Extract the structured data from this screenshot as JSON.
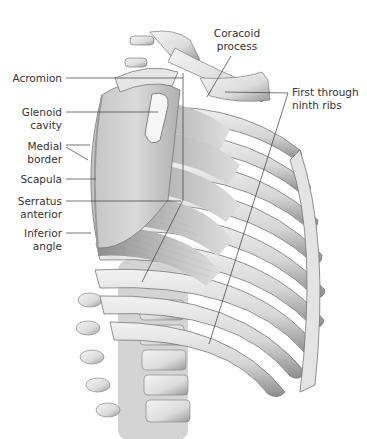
{
  "figure": {
    "colors": {
      "background": "#ffffff",
      "bone_light": "#eeeeee",
      "bone_mid": "#c8c8c8",
      "bone_dark": "#8a8a8a",
      "muscle": "#a9a9a9",
      "muscle_dark": "#6e6e6e",
      "leader_line": "#3a3a3a",
      "text": "#333333"
    }
  },
  "labels": [
    {
      "id": "acromion",
      "lines": [
        "Acromion"
      ],
      "side": "left"
    },
    {
      "id": "glenoid-cavity",
      "lines": [
        "Glenoid",
        "cavity"
      ],
      "side": "left"
    },
    {
      "id": "medial-border",
      "lines": [
        "Medial",
        "border"
      ],
      "side": "left"
    },
    {
      "id": "scapula",
      "lines": [
        "Scapula"
      ],
      "side": "left"
    },
    {
      "id": "serratus-anterior",
      "lines": [
        "Serratus",
        "anterior"
      ],
      "side": "left"
    },
    {
      "id": "inferior-angle",
      "lines": [
        "Inferior",
        "angle"
      ],
      "side": "left"
    },
    {
      "id": "coracoid-process",
      "lines": [
        "Coracoid",
        "process"
      ],
      "side": "top"
    },
    {
      "id": "first-through-ninth-ribs",
      "lines": [
        "First through",
        "ninth ribs"
      ],
      "side": "right"
    }
  ]
}
